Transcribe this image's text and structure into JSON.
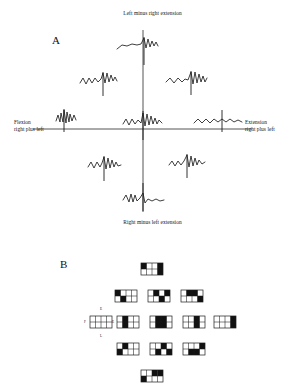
{
  "figure": {
    "width": 305,
    "height": 392,
    "background": "#ffffff",
    "ink_color": "#1c1c1c"
  },
  "panels": [
    {
      "id": "A",
      "label": "A",
      "x": 52,
      "y": 44
    },
    {
      "id": "B",
      "label": "B",
      "x": 60,
      "y": 268
    }
  ],
  "panel_a": {
    "axes": {
      "vertical": {
        "x": 143,
        "y1": 30,
        "y2": 212
      },
      "horizontal": {
        "y": 129,
        "x1": 33,
        "x2": 252
      }
    },
    "captions": {
      "top": {
        "text": "Left minus right extension",
        "x": 143,
        "y": 14
      },
      "bottom": {
        "text": "Right minus left extension",
        "x": 143,
        "y": 223
      },
      "left_line1": {
        "text": "Flexion",
        "x": 16,
        "y": 122
      },
      "left_line2": {
        "text": "right plus left",
        "x": 16,
        "y": 129
      },
      "right_line1": {
        "text": "Extension",
        "x": 248,
        "y": 122
      },
      "right_line2": {
        "text": "right plus left",
        "x": 248,
        "y": 129
      }
    },
    "traces": [
      {
        "name": "trace-top-center",
        "cx": 143,
        "cy": 45,
        "polyline": "-26,4 -21,0 -16,1 -11,-1 -6,0 -2,-1 1,-7 3,3 5,-6 7,2 9,-4 11,1 13,-3 15,1",
        "spike": {
          "x": 1,
          "y1": -8,
          "y2": 20
        }
      },
      {
        "name": "trace-upper-left",
        "cx": 102,
        "cy": 80,
        "polyline": "-22,3 -19,-2 -16,4 -13,-2 -10,3 -7,-2 -4,2 -1,-1 1,-7 3,3 5,-7 7,2 9,-5 11,1 13,-3 15,1",
        "spike": {
          "x": 1,
          "y1": -8,
          "y2": 16
        }
      },
      {
        "name": "trace-upper-right",
        "cx": 190,
        "cy": 80,
        "polyline": "-24,2 -20,-2 -16,3 -12,-2 -8,2 -5,-1 -2,0 1,-8 3,4 5,-8 7,3 9,-6 11,2 13,-4 15,2 17,-2",
        "spike": {
          "x": 1,
          "y1": -9,
          "y2": 15
        }
      },
      {
        "name": "trace-mid-left-far",
        "cx": 64,
        "cy": 119,
        "polyline": "-8,2 -6,-4 -4,3 -3,-6 -1,3 0,-9 2,4 3,-7 5,3 6,-5 8,2 10,-4 12,1",
        "spike": {
          "x": 0,
          "y1": -10,
          "y2": 13
        }
      },
      {
        "name": "trace-center",
        "cx": 143,
        "cy": 122,
        "polyline": "-20,2 -17,-3 -14,3 -11,-3 -8,2 -5,-2 -2,1 0,-9 2,4 4,-8 6,3 8,-6 10,2 12,-4 14,2 16,-2 19,1",
        "spike": {
          "x": 0,
          "y1": -11,
          "y2": 18
        }
      },
      {
        "name": "trace-mid-right-far",
        "cx": 222,
        "cy": 120,
        "polyline": "-28,3 -24,-1 -20,3 -16,-1 -12,3 -8,-1 -4,2 0,-1 4,2 8,-1 12,2 16,0 20,2",
        "spike": {
          "x": 0,
          "y1": -10,
          "y2": 12
        }
      },
      {
        "name": "trace-lower-left",
        "cx": 104,
        "cy": 165,
        "polyline": "-16,2 -13,-3 -10,3 -7,-3 -4,2 -2,-2 0,-8 2,4 4,-7 6,3 8,-5 10,2 12,-3 14,1 17,0",
        "spike": {
          "x": 0,
          "y1": -9,
          "y2": 16
        }
      },
      {
        "name": "trace-lower-right",
        "cx": 187,
        "cy": 163,
        "polyline": "-18,2 -15,-2 -12,3 -9,-2 -6,2 -3,-2 0,-8 2,4 4,-7 6,3 8,-5 10,2 12,-3 15,1 18,-1",
        "spike": {
          "x": 0,
          "y1": -9,
          "y2": 15
        }
      },
      {
        "name": "trace-bottom-center",
        "cx": 143,
        "cy": 199,
        "polyline": "-20,1 -17,-4 -14,3 -12,-5 -10,3 -8,-4 -6,2 -3,-1 0,-6 2,4 5,0 9,2 13,0 17,2 21,1",
        "spike": {
          "x": 0,
          "y1": -16,
          "y2": 12
        }
      }
    ]
  },
  "panel_b": {
    "cell": {
      "width": 22,
      "height": 12,
      "cols": 4,
      "rows": 2
    },
    "annotations": [
      {
        "name": "micro-label-top",
        "text": "E",
        "x": 101,
        "y": 310
      },
      {
        "name": "micro-label-left",
        "text": "F",
        "x": 85,
        "y": 323
      },
      {
        "name": "micro-label-right",
        "text": "E",
        "x": 113,
        "y": 323
      },
      {
        "name": "micro-label-bottom",
        "text": "L",
        "x": 101,
        "y": 337
      }
    ],
    "cells": [
      {
        "name": "cell-top-center",
        "x": 141,
        "y": 263,
        "fill": [
          [
            1,
            0,
            0,
            1
          ],
          [
            0,
            0,
            0,
            1
          ]
        ]
      },
      {
        "name": "cell-upper-left",
        "x": 115,
        "y": 290,
        "fill": [
          [
            1,
            0,
            0,
            0
          ],
          [
            0,
            1,
            0,
            0
          ]
        ]
      },
      {
        "name": "cell-upper-center",
        "x": 148,
        "y": 290,
        "fill": [
          [
            0,
            1,
            0,
            1
          ],
          [
            0,
            0,
            1,
            0
          ]
        ]
      },
      {
        "name": "cell-upper-right",
        "x": 181,
        "y": 290,
        "fill": [
          [
            0,
            1,
            1,
            0
          ],
          [
            0,
            0,
            0,
            1
          ]
        ]
      },
      {
        "name": "cell-mid-far-left",
        "x": 90,
        "y": 316,
        "fill": [
          [
            0,
            0,
            0,
            0
          ],
          [
            0,
            0,
            0,
            0
          ]
        ]
      },
      {
        "name": "cell-mid-left",
        "x": 117,
        "y": 316,
        "fill": [
          [
            0,
            1,
            0,
            0
          ],
          [
            0,
            1,
            0,
            0
          ]
        ]
      },
      {
        "name": "cell-mid-center",
        "x": 150,
        "y": 316,
        "fill": [
          [
            0,
            1,
            1,
            0
          ],
          [
            0,
            1,
            1,
            0
          ]
        ]
      },
      {
        "name": "cell-mid-right",
        "x": 183,
        "y": 316,
        "fill": [
          [
            0,
            0,
            1,
            0
          ],
          [
            0,
            0,
            1,
            0
          ]
        ]
      },
      {
        "name": "cell-mid-far-right",
        "x": 214,
        "y": 316,
        "fill": [
          [
            0,
            0,
            0,
            1
          ],
          [
            0,
            0,
            0,
            1
          ]
        ]
      },
      {
        "name": "cell-lower-left",
        "x": 117,
        "y": 343,
        "fill": [
          [
            0,
            1,
            0,
            0
          ],
          [
            1,
            0,
            0,
            0
          ]
        ]
      },
      {
        "name": "cell-lower-center",
        "x": 150,
        "y": 343,
        "fill": [
          [
            0,
            0,
            1,
            0
          ],
          [
            0,
            1,
            0,
            1
          ]
        ]
      },
      {
        "name": "cell-lower-right",
        "x": 183,
        "y": 343,
        "fill": [
          [
            0,
            0,
            0,
            1
          ],
          [
            0,
            1,
            1,
            0
          ]
        ]
      },
      {
        "name": "cell-bottom-center",
        "x": 141,
        "y": 370,
        "fill": [
          [
            0,
            0,
            1,
            1
          ],
          [
            1,
            0,
            0,
            0
          ]
        ]
      }
    ]
  }
}
